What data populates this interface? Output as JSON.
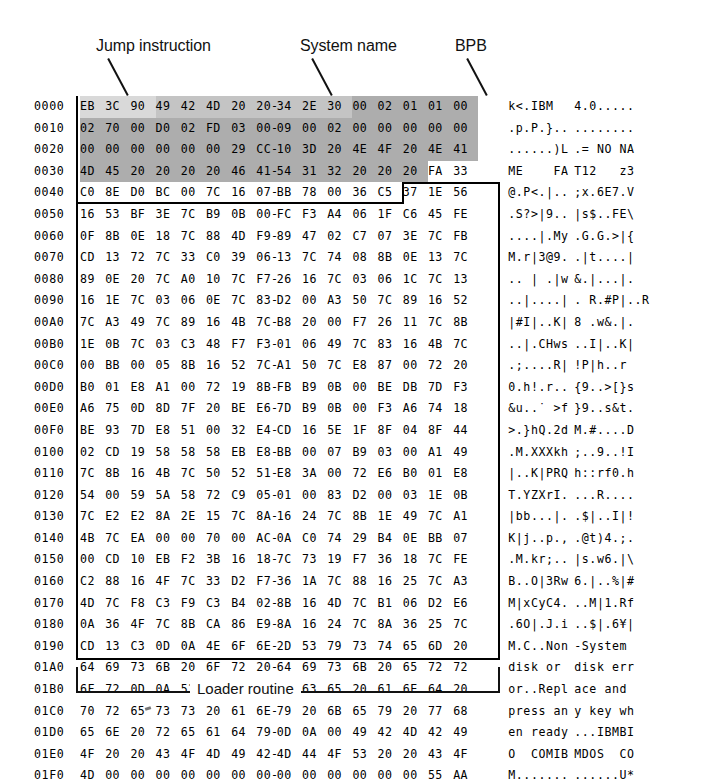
{
  "figure": {
    "annotations": [
      {
        "id": "jump",
        "label": "Jump instruction"
      },
      {
        "id": "system",
        "label": "System name"
      },
      {
        "id": "bpb",
        "label": "BPB"
      }
    ],
    "bottom_bracket_label": "Loader routine",
    "colors": {
      "ink": "#000000",
      "shade_light": "#d9d9d9",
      "shade_mid": "#c4c4c4",
      "shade_dark": "#adadad",
      "paper": "#ffffff"
    }
  },
  "hexdump": {
    "bytes_per_row": 16,
    "separator": "-",
    "rows": [
      {
        "address": "0000",
        "bytes": [
          "EB",
          "3C",
          "90",
          "49",
          "42",
          "4D",
          "20",
          "20",
          "34",
          "2E",
          "30",
          "00",
          "02",
          "01",
          "01",
          "00"
        ],
        "ascii_left": "k<.IBM",
        "ascii_right": "4.0....."
      },
      {
        "address": "0010",
        "bytes": [
          "02",
          "70",
          "00",
          "D0",
          "02",
          "FD",
          "03",
          "00",
          "09",
          "00",
          "02",
          "00",
          "00",
          "00",
          "00",
          "00"
        ],
        "ascii_left": ".p.P.}..",
        "ascii_right": "........"
      },
      {
        "address": "0020",
        "bytes": [
          "00",
          "00",
          "00",
          "00",
          "00",
          "00",
          "29",
          "CC",
          "10",
          "3D",
          "20",
          "4E",
          "4F",
          "20",
          "4E",
          "41"
        ],
        "ascii_left": "......)L",
        "ascii_right": ".= NO NA"
      },
      {
        "address": "0030",
        "bytes": [
          "4D",
          "45",
          "20",
          "20",
          "20",
          "20",
          "46",
          "41",
          "54",
          "31",
          "32",
          "20",
          "20",
          "20",
          "FA",
          "33"
        ],
        "ascii_left": "ME    FA",
        "ascii_right": "T12   z3"
      },
      {
        "address": "0040",
        "bytes": [
          "C0",
          "8E",
          "D0",
          "BC",
          "00",
          "7C",
          "16",
          "07",
          "BB",
          "78",
          "00",
          "36",
          "C5",
          "37",
          "1E",
          "56"
        ],
        "ascii_left": "@.P<.|..",
        "ascii_right": ";x.6E7.V"
      },
      {
        "address": "0050",
        "bytes": [
          "16",
          "53",
          "BF",
          "3E",
          "7C",
          "B9",
          "0B",
          "00",
          "FC",
          "F3",
          "A4",
          "06",
          "1F",
          "C6",
          "45",
          "FE"
        ],
        "ascii_left": ".S?>|9..",
        "ascii_right": "|s$..FE\\"
      },
      {
        "address": "0060",
        "bytes": [
          "0F",
          "8B",
          "0E",
          "18",
          "7C",
          "88",
          "4D",
          "F9",
          "89",
          "47",
          "02",
          "C7",
          "07",
          "3E",
          "7C",
          "FB"
        ],
        "ascii_left": "....|.My",
        "ascii_right": ".G.G.>|{"
      },
      {
        "address": "0070",
        "bytes": [
          "CD",
          "13",
          "72",
          "7C",
          "33",
          "C0",
          "39",
          "06",
          "13",
          "7C",
          "74",
          "08",
          "8B",
          "0E",
          "13",
          "7C"
        ],
        "ascii_left": "M.r|3@9.",
        "ascii_right": ".|t....|"
      },
      {
        "address": "0080",
        "bytes": [
          "89",
          "0E",
          "20",
          "7C",
          "A0",
          "10",
          "7C",
          "F7",
          "26",
          "16",
          "7C",
          "03",
          "06",
          "1C",
          "7C",
          "13"
        ],
        "ascii_left": ".. | .|w",
        "ascii_right": "&.|...|."
      },
      {
        "address": "0090",
        "bytes": [
          "16",
          "1E",
          "7C",
          "03",
          "06",
          "0E",
          "7C",
          "83",
          "D2",
          "00",
          "A3",
          "50",
          "7C",
          "89",
          "16",
          "52"
        ],
        "ascii_left": "..|....|",
        "ascii_right": ". R.#P|..R"
      },
      {
        "address": "00A0",
        "bytes": [
          "7C",
          "A3",
          "49",
          "7C",
          "89",
          "16",
          "4B",
          "7C",
          "B8",
          "20",
          "00",
          "F7",
          "26",
          "11",
          "7C",
          "8B"
        ],
        "ascii_left": "|#I|..K|",
        "ascii_right": "8 .w&.|."
      },
      {
        "address": "00B0",
        "bytes": [
          "1E",
          "0B",
          "7C",
          "03",
          "C3",
          "48",
          "F7",
          "F3",
          "01",
          "06",
          "49",
          "7C",
          "83",
          "16",
          "4B",
          "7C"
        ],
        "ascii_left": "..|.CHws",
        "ascii_right": "..I|..K|"
      },
      {
        "address": "00C0",
        "bytes": [
          "00",
          "BB",
          "00",
          "05",
          "8B",
          "16",
          "52",
          "7C",
          "A1",
          "50",
          "7C",
          "E8",
          "87",
          "00",
          "72",
          "20"
        ],
        "ascii_left": ".;....R|",
        "ascii_right": "!P|h..r"
      },
      {
        "address": "00D0",
        "bytes": [
          "B0",
          "01",
          "E8",
          "A1",
          "00",
          "72",
          "19",
          "8B",
          "FB",
          "B9",
          "0B",
          "00",
          "BE",
          "DB",
          "7D",
          "F3"
        ],
        "ascii_left": "0.h!.r..",
        "ascii_right": "{9..>[}s"
      },
      {
        "address": "00E0",
        "bytes": [
          "A6",
          "75",
          "0D",
          "8D",
          "7F",
          "20",
          "BE",
          "E6",
          "7D",
          "B9",
          "0B",
          "00",
          "F3",
          "A6",
          "74",
          "18"
        ],
        "ascii_left": "&u..˙ >f",
        "ascii_right": "}9..s&t."
      },
      {
        "address": "00F0",
        "bytes": [
          "BE",
          "93",
          "7D",
          "E8",
          "51",
          "00",
          "32",
          "E4",
          "CD",
          "16",
          "5E",
          "1F",
          "8F",
          "04",
          "8F",
          "44"
        ],
        "ascii_left": ">.}hQ.2d",
        "ascii_right": "M.#....D"
      },
      {
        "address": "0100",
        "bytes": [
          "02",
          "CD",
          "19",
          "58",
          "58",
          "58",
          "EB",
          "E8",
          "BB",
          "00",
          "07",
          "B9",
          "03",
          "00",
          "A1",
          "49"
        ],
        "ascii_left": ".M.XXXkh",
        "ascii_right": ";..9..!I"
      },
      {
        "address": "0110",
        "bytes": [
          "7C",
          "8B",
          "16",
          "4B",
          "7C",
          "50",
          "52",
          "51",
          "E8",
          "3A",
          "00",
          "72",
          "E6",
          "B0",
          "01",
          "E8"
        ],
        "ascii_left": "|..K|PRQ",
        "ascii_right": "h::rf0.h"
      },
      {
        "address": "0120",
        "bytes": [
          "54",
          "00",
          "59",
          "5A",
          "58",
          "72",
          "C9",
          "05",
          "01",
          "00",
          "83",
          "D2",
          "00",
          "03",
          "1E",
          "0B"
        ],
        "ascii_left": "T.YZXrI.",
        "ascii_right": "...R...."
      },
      {
        "address": "0130",
        "bytes": [
          "7C",
          "E2",
          "E2",
          "8A",
          "2E",
          "15",
          "7C",
          "8A",
          "16",
          "24",
          "7C",
          "8B",
          "1E",
          "49",
          "7C",
          "A1"
        ],
        "ascii_left": "|bb...|.",
        "ascii_right": ".$|..I|!"
      },
      {
        "address": "0140",
        "bytes": [
          "4B",
          "7C",
          "EA",
          "00",
          "00",
          "70",
          "00",
          "AC",
          "0A",
          "C0",
          "74",
          "29",
          "B4",
          "0E",
          "BB",
          "07"
        ],
        "ascii_left": "K|j..p.,",
        "ascii_right": ".@t)4.;."
      },
      {
        "address": "0150",
        "bytes": [
          "00",
          "CD",
          "10",
          "EB",
          "F2",
          "3B",
          "16",
          "18",
          "7C",
          "73",
          "19",
          "F7",
          "36",
          "18",
          "7C",
          "FE"
        ],
        "ascii_left": ".M.kr;..",
        "ascii_right": "|s.w6.|\\"
      },
      {
        "address": "0160",
        "bytes": [
          "C2",
          "88",
          "16",
          "4F",
          "7C",
          "33",
          "D2",
          "F7",
          "36",
          "1A",
          "7C",
          "88",
          "16",
          "25",
          "7C",
          "A3"
        ],
        "ascii_left": "B..O|3Rw",
        "ascii_right": "6.|..%|#"
      },
      {
        "address": "0170",
        "bytes": [
          "4D",
          "7C",
          "F8",
          "C3",
          "F9",
          "C3",
          "B4",
          "02",
          "8B",
          "16",
          "4D",
          "7C",
          "B1",
          "06",
          "D2",
          "E6"
        ],
        "ascii_left": "M|xCyC4.",
        "ascii_right": "..M|1.Rf"
      },
      {
        "address": "0180",
        "bytes": [
          "0A",
          "36",
          "4F",
          "7C",
          "8B",
          "CA",
          "86",
          "E9",
          "8A",
          "16",
          "24",
          "7C",
          "8A",
          "36",
          "25",
          "7C"
        ],
        "ascii_left": ".6O|.J.i",
        "ascii_right": "..$|.6¥|"
      },
      {
        "address": "0190",
        "bytes": [
          "CD",
          "13",
          "C3",
          "0D",
          "0A",
          "4E",
          "6F",
          "6E",
          "2D",
          "53",
          "79",
          "73",
          "74",
          "65",
          "6D",
          "20"
        ],
        "ascii_left": "M.C..Non",
        "ascii_right": "-System"
      },
      {
        "address": "01A0",
        "bytes": [
          "64",
          "69",
          "73",
          "6B",
          "20",
          "6F",
          "72",
          "20",
          "64",
          "69",
          "73",
          "6B",
          "20",
          "65",
          "72",
          "72"
        ],
        "ascii_left": "disk or",
        "ascii_right": "disk err"
      },
      {
        "address": "01B0",
        "bytes": [
          "6F",
          "72",
          "0D",
          "0A",
          "52",
          "65",
          "70",
          "6C",
          "61",
          "63",
          "65",
          "20",
          "61",
          "6E",
          "64",
          "20"
        ],
        "ascii_left": "or..Repl",
        "ascii_right": "ace and"
      },
      {
        "address": "01C0",
        "bytes": [
          "70",
          "72",
          "65",
          "73",
          "73",
          "20",
          "61",
          "6E",
          "79",
          "20",
          "6B",
          "65",
          "79",
          "20",
          "77",
          "68"
        ],
        "ascii_left": "press an",
        "ascii_right": "y key wh"
      },
      {
        "address": "01D0",
        "bytes": [
          "65",
          "6E",
          "20",
          "72",
          "65",
          "61",
          "64",
          "79",
          "0D",
          "0A",
          "00",
          "49",
          "42",
          "4D",
          "42",
          "49"
        ],
        "ascii_left": "en ready",
        "ascii_right": "...IBMBI"
      },
      {
        "address": "01E0",
        "bytes": [
          "4F",
          "20",
          "20",
          "43",
          "4F",
          "4D",
          "49",
          "42",
          "4D",
          "44",
          "4F",
          "53",
          "20",
          "20",
          "43",
          "4F"
        ],
        "ascii_left": "O  COMIB",
        "ascii_right": "MDOS  CO"
      },
      {
        "address": "01F0",
        "bytes": [
          "4D",
          "00",
          "00",
          "00",
          "00",
          "00",
          "00",
          "00",
          "00",
          "00",
          "00",
          "00",
          "00",
          "00",
          "55",
          "AA"
        ],
        "ascii_left": "M.......",
        "ascii_right": "......U*"
      }
    ]
  }
}
